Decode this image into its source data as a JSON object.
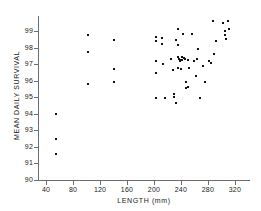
{
  "chart_data": {
    "type": "scatter",
    "title": "",
    "xlabel": "LENGTH (mm)",
    "ylabel": "MEAN DAILY SURVIVAL",
    "xlim": [
      28,
      338
    ],
    "ylim": [
      90,
      99.8
    ],
    "xticks": [
      40,
      80,
      120,
      160,
      200,
      240,
      280,
      320
    ],
    "xtick_labels": [
      "40",
      "80",
      "120",
      "160",
      "200",
      "240",
      "280",
      "320"
    ],
    "yticks": [
      90,
      91,
      92,
      93,
      94,
      95,
      96,
      97,
      98,
      99
    ],
    "ytick_labels": [
      "90",
      "91",
      "92",
      "93",
      "94",
      "95",
      "96",
      "97",
      "98",
      "99"
    ],
    "grid": false,
    "legend": false,
    "marker": "square",
    "marker_color": "#111111",
    "axis_color": "#6d6d6d",
    "background_color": "#ffffff",
    "n_points": 62,
    "points": [
      {
        "x": 55,
        "y": 94.0
      },
      {
        "x": 55,
        "y": 92.5
      },
      {
        "x": 55,
        "y": 91.55
      },
      {
        "x": 102,
        "y": 98.75
      },
      {
        "x": 102,
        "y": 97.75
      },
      {
        "x": 102,
        "y": 95.8
      },
      {
        "x": 141,
        "y": 98.45
      },
      {
        "x": 141,
        "y": 96.7
      },
      {
        "x": 141,
        "y": 95.95
      },
      {
        "x": 203,
        "y": 98.65
      },
      {
        "x": 203,
        "y": 98.4
      },
      {
        "x": 203,
        "y": 97.2
      },
      {
        "x": 203,
        "y": 96.45
      },
      {
        "x": 203,
        "y": 94.95
      },
      {
        "x": 212,
        "y": 98.6
      },
      {
        "x": 212,
        "y": 98.2
      },
      {
        "x": 214,
        "y": 97.0
      },
      {
        "x": 216,
        "y": 94.95
      },
      {
        "x": 226,
        "y": 97.3
      },
      {
        "x": 228,
        "y": 96.65
      },
      {
        "x": 229,
        "y": 95.2
      },
      {
        "x": 229,
        "y": 95.05
      },
      {
        "x": 232,
        "y": 94.65
      },
      {
        "x": 236,
        "y": 99.15
      },
      {
        "x": 236,
        "y": 98.15
      },
      {
        "x": 236,
        "y": 97.45
      },
      {
        "x": 237,
        "y": 97.35
      },
      {
        "x": 238,
        "y": 97.25
      },
      {
        "x": 239,
        "y": 97.2
      },
      {
        "x": 241,
        "y": 97.45
      },
      {
        "x": 241,
        "y": 97.25
      },
      {
        "x": 242,
        "y": 97.25
      },
      {
        "x": 243,
        "y": 98.85
      },
      {
        "x": 244,
        "y": 97.4
      },
      {
        "x": 246,
        "y": 97.35
      },
      {
        "x": 247,
        "y": 95.9
      },
      {
        "x": 248,
        "y": 95.55
      },
      {
        "x": 250,
        "y": 97.25
      },
      {
        "x": 251,
        "y": 95.65
      },
      {
        "x": 256,
        "y": 98.85
      },
      {
        "x": 259,
        "y": 97.2
      },
      {
        "x": 263,
        "y": 96.3
      },
      {
        "x": 264,
        "y": 97.3
      },
      {
        "x": 266,
        "y": 97.95
      },
      {
        "x": 268,
        "y": 94.95
      },
      {
        "x": 272,
        "y": 96.9
      },
      {
        "x": 276,
        "y": 95.9
      },
      {
        "x": 281,
        "y": 97.2
      },
      {
        "x": 284,
        "y": 97.05
      },
      {
        "x": 287,
        "y": 99.6
      },
      {
        "x": 289,
        "y": 97.6
      },
      {
        "x": 292,
        "y": 98.4
      },
      {
        "x": 303,
        "y": 99.5
      },
      {
        "x": 305,
        "y": 99.0
      },
      {
        "x": 306,
        "y": 98.75
      },
      {
        "x": 307,
        "y": 98.5
      },
      {
        "x": 310,
        "y": 99.6
      },
      {
        "x": 312,
        "y": 99.15
      },
      {
        "x": 232,
        "y": 98.45
      },
      {
        "x": 236,
        "y": 96.75
      },
      {
        "x": 240,
        "y": 96.7
      },
      {
        "x": 252,
        "y": 96.75
      }
    ]
  }
}
